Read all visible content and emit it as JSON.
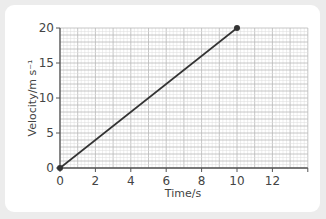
{
  "chart_data": {
    "type": "line",
    "title": "",
    "xlabel": "Time/s",
    "ylabel": "Velocity/m s⁻¹",
    "xlim": [
      0,
      14
    ],
    "ylim": [
      0,
      20
    ],
    "xticks": [
      "0",
      "2",
      "4",
      "6",
      "8",
      "10",
      "12"
    ],
    "yticks": [
      "0",
      "5",
      "10",
      "15",
      "20"
    ],
    "grid": true,
    "legend": null,
    "series": [
      {
        "name": "velocity",
        "x": [
          0,
          10
        ],
        "y": [
          0,
          20
        ],
        "color": "#333333",
        "markers": true
      }
    ]
  },
  "colors": {
    "background": "#ececec",
    "card": "#ffffff",
    "grid_minor": "#dcdcdc",
    "grid_major": "#b8b8b8",
    "axis": "#555555",
    "line": "#333333"
  }
}
